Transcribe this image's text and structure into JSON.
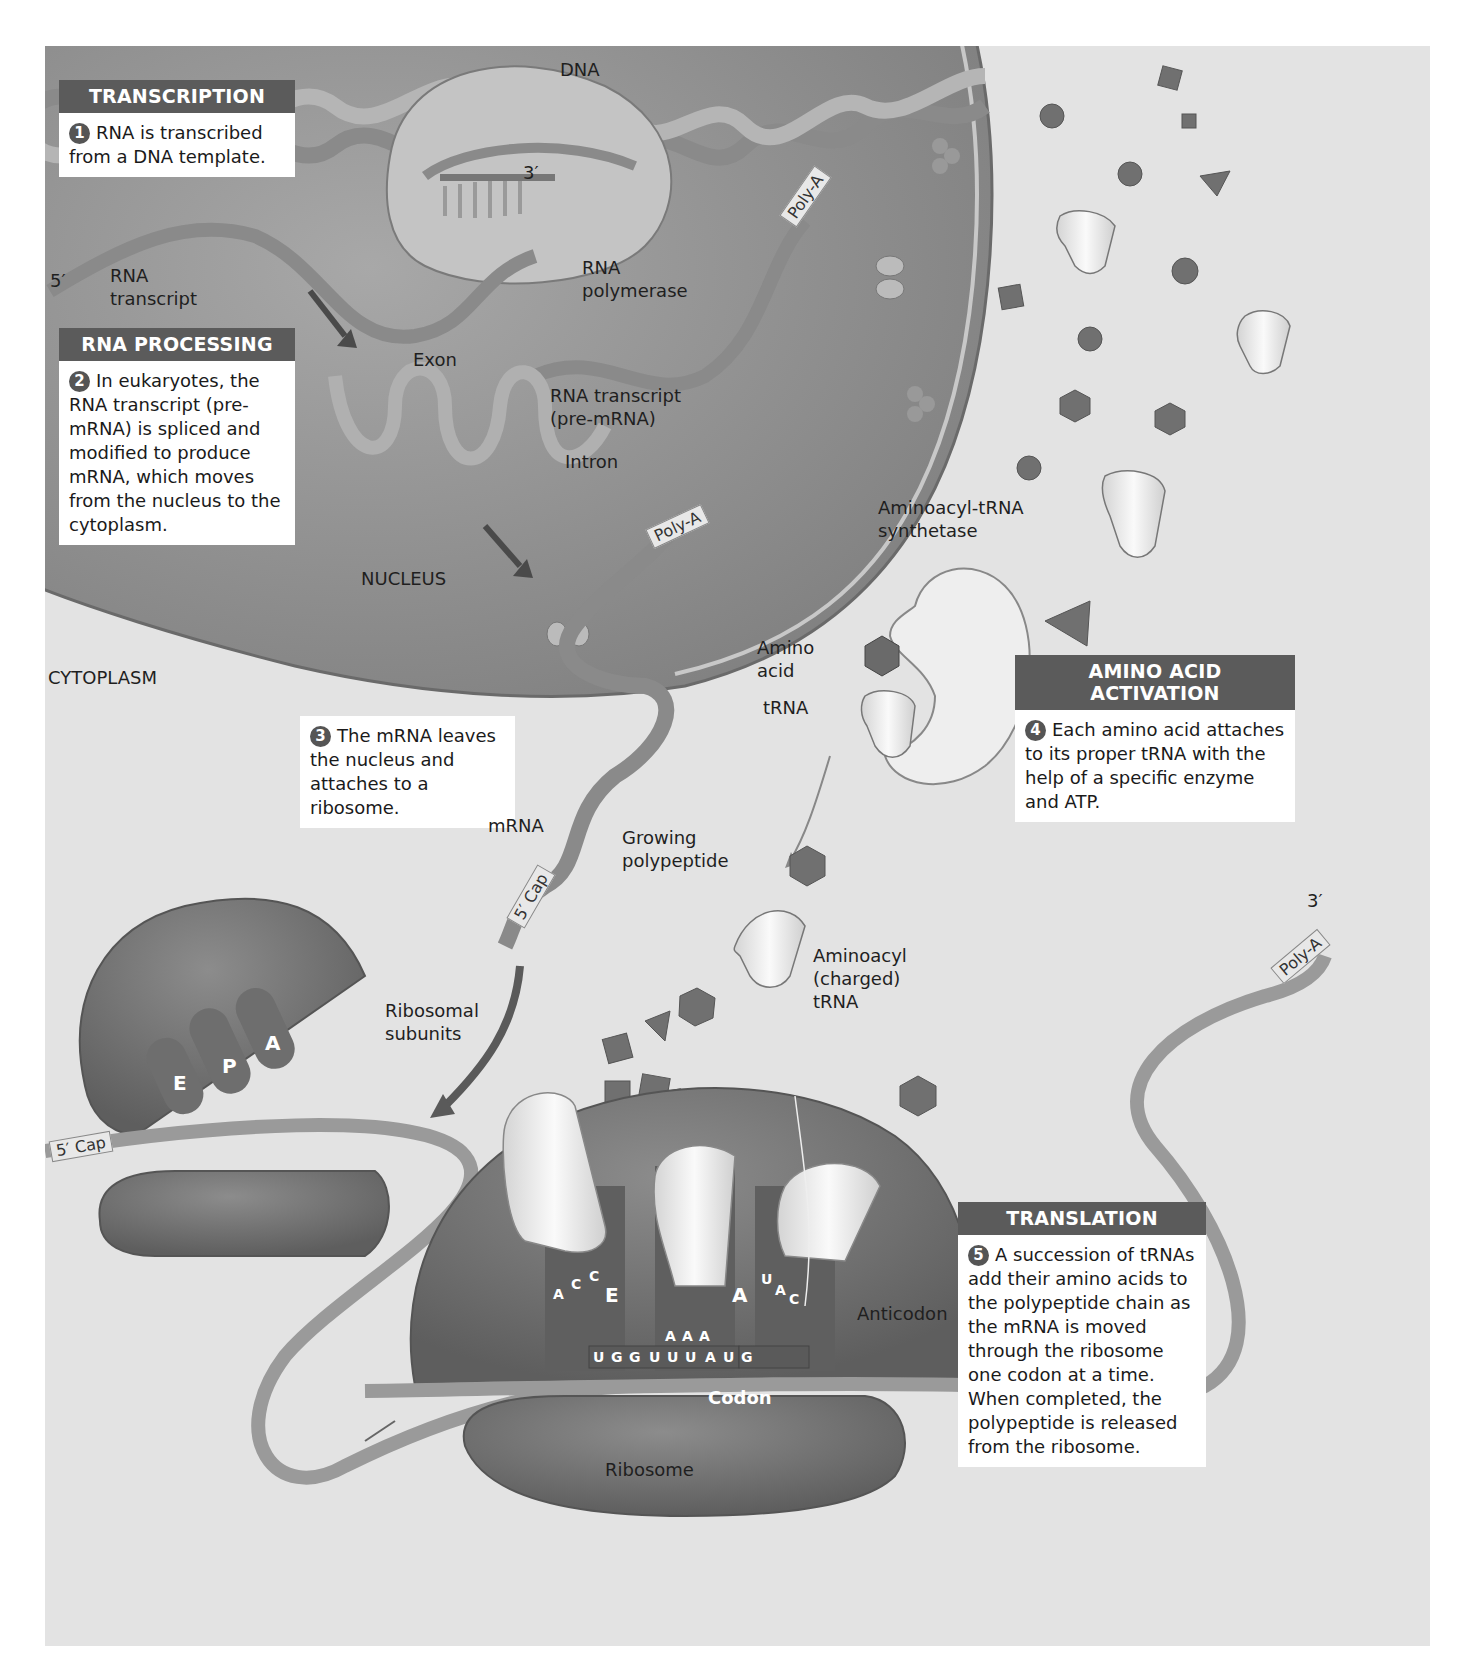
{
  "boxes": {
    "transcription": {
      "title": "TRANSCRIPTION",
      "step": "1",
      "text": "RNA is transcribed from a DNA template."
    },
    "rna_processing": {
      "title": "RNA PROCESSING",
      "step": "2",
      "text": "In eukaryotes, the RNA transcript (pre-mRNA) is spliced and modified to produce mRNA, which moves from the nucleus to the cytoplasm."
    },
    "mrna_leaves": {
      "step": "3",
      "text": "The mRNA leaves the nucleus and attaches to a ribosome."
    },
    "amino_acid_activation": {
      "title": "AMINO ACID ACTIVATION",
      "step": "4",
      "text": "Each amino acid attaches to its proper tRNA with the help of a specific enzyme and ATP."
    },
    "translation": {
      "title": "TRANSLATION",
      "step": "5",
      "text": "A succession of tRNAs add their amino acids to the polypeptide chain as the mRNA is moved through the ribosome one codon at a time. When completed, the polypeptide is released from the ribosome."
    }
  },
  "labels": {
    "dna": "DNA",
    "three_prime_top": "3′",
    "five_prime": "5′",
    "rna_transcript_1": "RNA",
    "rna_transcript_2": "transcript",
    "rna_polymerase_1": "RNA",
    "rna_polymerase_2": "polymerase",
    "exon": "Exon",
    "pre_mrna_1": "RNA transcript",
    "pre_mrna_2": "(pre-mRNA)",
    "intron": "Intron",
    "nucleus": "NUCLEUS",
    "cytoplasm": "CYTOPLASM",
    "synthetase_1": "Aminoacyl-tRNA",
    "synthetase_2": "synthetase",
    "amino_acid_1": "Amino",
    "amino_acid_2": "acid",
    "trna": "tRNA",
    "mrna": "mRNA",
    "growing_1": "Growing",
    "growing_2": "polypeptide",
    "aminoacyl_1": "Aminoacyl",
    "aminoacyl_2": "(charged)",
    "aminoacyl_3": "tRNA",
    "ribosomal_1": "Ribosomal",
    "ribosomal_2": "subunits",
    "anticodon": "Anticodon",
    "codon": "Codon",
    "ribosome": "Ribosome",
    "three_prime_right": "3′"
  },
  "tags": {
    "poly_a_top": "Poly-A",
    "poly_a_mid": "Poly-A",
    "poly_a_right": "Poly-A",
    "cap_mid": "5′ Cap",
    "cap_left": "5′ Cap"
  },
  "sites": {
    "subunit": [
      "E",
      "P",
      "A"
    ],
    "ribosome_e": "E",
    "ribosome_a": "A"
  },
  "anticodons": {
    "e_site": [
      "A",
      "C",
      "C"
    ],
    "p_site": [
      "A",
      "A",
      "A"
    ],
    "a_site": [
      "U",
      "A",
      "C"
    ]
  },
  "mrna_codons": [
    "U",
    "G",
    "G",
    "U",
    "U",
    "U",
    "A",
    "U",
    "G"
  ],
  "colors": {
    "nucleus": "#8f8f8f",
    "ribosome": "#7a7a7a",
    "box_header": "#5b5b5b",
    "background": "#e3e3e3",
    "trna": "#f2f2f2"
  }
}
